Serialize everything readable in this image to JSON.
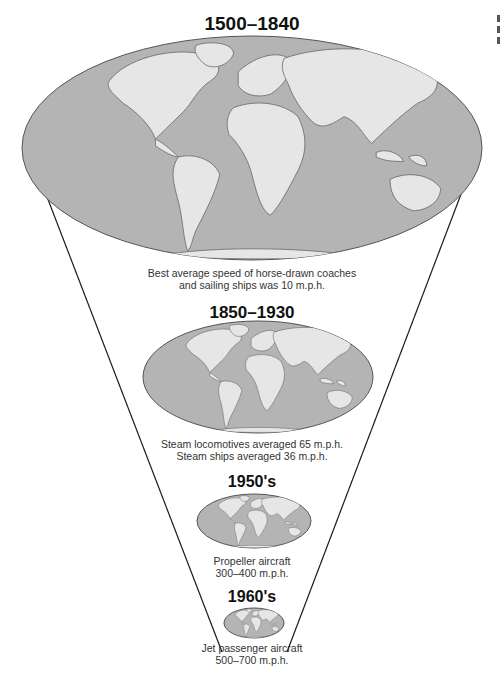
{
  "figure": {
    "stages": [
      {
        "era": "1500–1840",
        "caption_lines": [
          "Best average speed of horse-drawn coaches",
          "and sailing ships was 10 m.p.h."
        ],
        "map": "world-map-large"
      },
      {
        "era": "1850–1930",
        "caption_lines": [
          "Steam locomotives averaged 65 m.p.h.",
          "Steam ships averaged 36 m.p.h."
        ],
        "map": "world-map-medium"
      },
      {
        "era": "1950's",
        "caption_lines": [
          "Propeller aircraft",
          "300–400 m.p.h."
        ],
        "map": "world-map-small"
      },
      {
        "era": "1960's",
        "caption_lines": [
          "Jet passenger aircraft",
          "500–700 m.p.h."
        ],
        "map": "world-map-smallest"
      }
    ],
    "colors": {
      "ocean": "#b4b4b4",
      "land": "#e6e6e6",
      "outline": "#555555",
      "funnel_line": "#1a1a1a"
    }
  }
}
